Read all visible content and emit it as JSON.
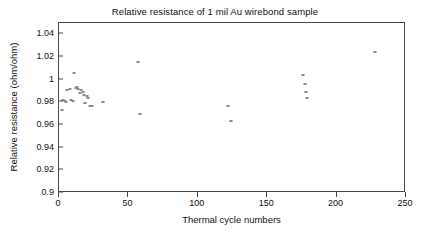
{
  "chart_data": {
    "type": "scatter",
    "title": "Relative resistance of 1 mil Au wirebond sample",
    "xlabel": "Thermal cycle numbers",
    "ylabel": "Relative resistance (ohm/ohm)",
    "xlim": [
      0,
      250
    ],
    "ylim": [
      0.9,
      1.05
    ],
    "xticks": [
      0,
      50,
      100,
      150,
      200,
      250
    ],
    "xtick_labels": [
      "0",
      "50",
      "100",
      "150",
      "200",
      "250"
    ],
    "yticks": [
      0.9,
      0.92,
      0.94,
      0.96,
      0.98,
      1.0,
      1.02,
      1.04
    ],
    "ytick_labels": [
      "0.9",
      "0.92",
      "0.94",
      "0.96",
      "0.98",
      "1",
      "1.02",
      "1.04"
    ],
    "grid": false,
    "legend": null,
    "marker_color": "#8a8a8a",
    "axis_color": "#4a4a4a",
    "series": [
      {
        "name": "Relative resistance",
        "points": [
          [
            2,
            0.9735
          ],
          [
            3,
            0.9825
          ],
          [
            4,
            0.9815
          ],
          [
            5,
            0.9805
          ],
          [
            6,
            0.9905
          ],
          [
            8,
            0.9915
          ],
          [
            9,
            0.9825
          ],
          [
            10,
            0.9815
          ],
          [
            11,
            1.0058
          ],
          [
            12,
            0.9928
          ],
          [
            13,
            0.9935
          ],
          [
            14,
            0.9922
          ],
          [
            15,
            0.9885
          ],
          [
            16,
            0.9908
          ],
          [
            17,
            0.9895
          ],
          [
            18,
            0.9862
          ],
          [
            19,
            0.9795
          ],
          [
            20,
            0.9858
          ],
          [
            21,
            0.9838
          ],
          [
            22,
            0.9772
          ],
          [
            24,
            0.9768
          ],
          [
            32,
            0.9802
          ],
          [
            57,
            1.0152
          ],
          [
            58,
            0.9698
          ],
          [
            122,
            0.9772
          ],
          [
            124,
            0.9638
          ],
          [
            176,
            1.0038
          ],
          [
            177,
            0.9958
          ],
          [
            178,
            0.9888
          ],
          [
            179,
            0.9842
          ],
          [
            228,
            1.0248
          ]
        ]
      }
    ]
  }
}
